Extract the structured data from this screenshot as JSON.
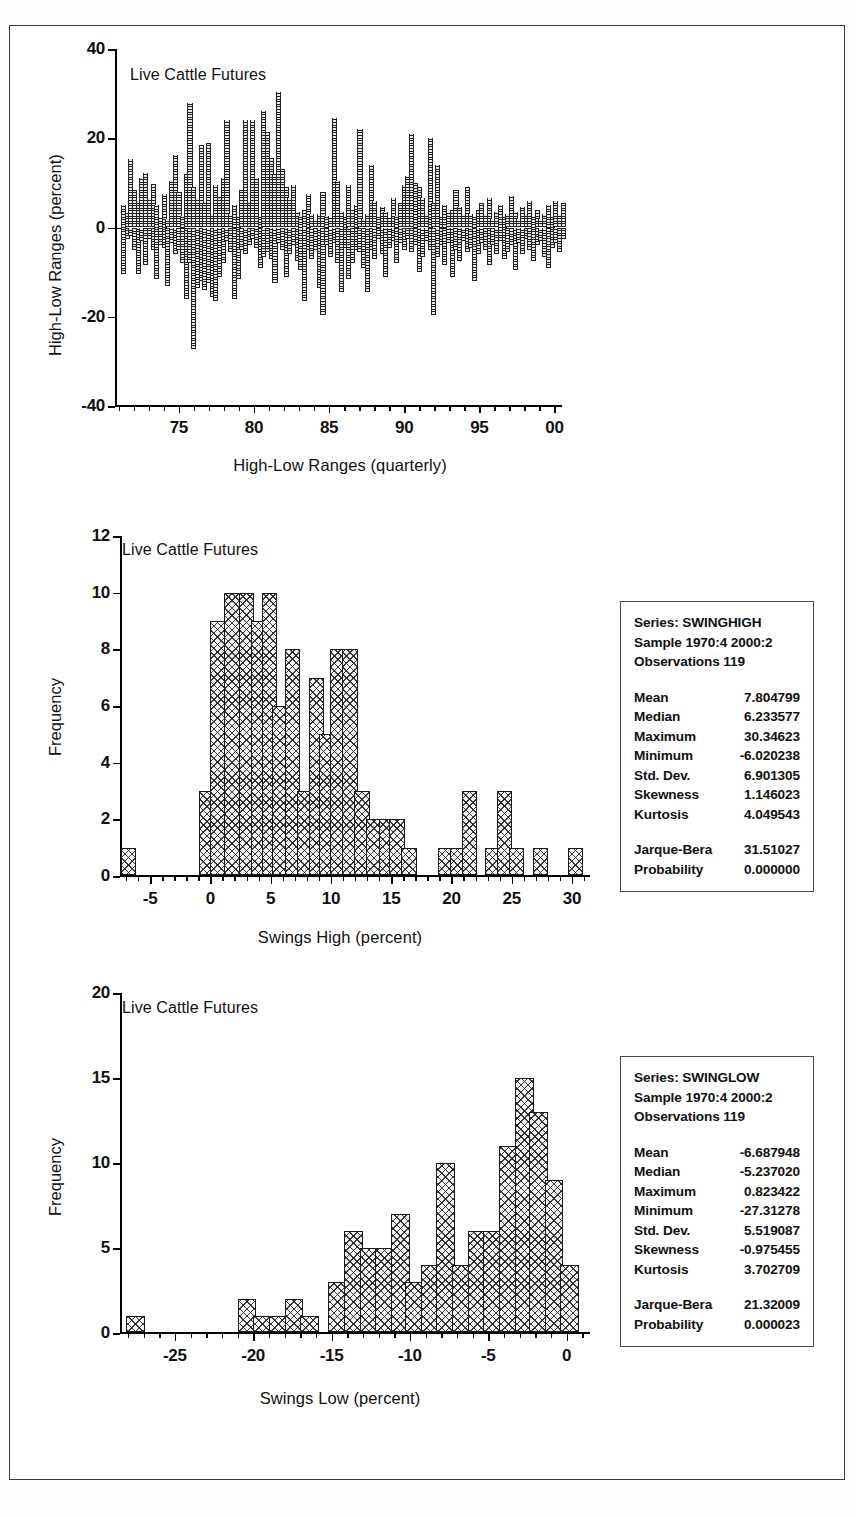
{
  "figure": {
    "border_color": "#3a3a3a",
    "background": "#ffffff"
  },
  "chart_data": [
    {
      "id": "high-low-ranges",
      "type": "bar",
      "title": "Live Cattle Futures",
      "xlabel": "High-Low Ranges (quarterly)",
      "ylabel": "High-Low Ranges (percent)",
      "ylim": [
        -40,
        40
      ],
      "yticks": [
        -40,
        -20,
        0,
        20,
        40
      ],
      "xlim": [
        1970.75,
        2000.5
      ],
      "xticks": [
        75,
        80,
        85,
        90,
        95,
        0
      ],
      "xticklabels": [
        "75",
        "80",
        "85",
        "90",
        "95",
        "00"
      ],
      "xtick_values": [
        1975,
        1980,
        1985,
        1990,
        1995,
        2000
      ],
      "minor_tick_step": 1,
      "grid": false,
      "legend": "none",
      "series": [
        {
          "name": "SWINGHIGH",
          "values": [
            5.0,
            3.2,
            15.4,
            8.5,
            6.0,
            11.0,
            12.2,
            6.5,
            9.8,
            5.0,
            2.2,
            7.5,
            2.0,
            10.5,
            16.3,
            8.0,
            2.5,
            12.0,
            27.8,
            9.0,
            6.5,
            18.5,
            5.5,
            19.0,
            3.0,
            9.5,
            7.0,
            11.2,
            24.0,
            3.0,
            5.0,
            2.5,
            8.5,
            24.0,
            6.0,
            24.0,
            11.2,
            2.5,
            26.0,
            21.5,
            15.5,
            12.0,
            30.3,
            13.0,
            9.0,
            6.5,
            9.5,
            3.5,
            2.5,
            4.0,
            7.5,
            3.0,
            2.0,
            3.0,
            8.0,
            2.5,
            2.2,
            24.5,
            10.5,
            3.5,
            2.5,
            9.5,
            4.0,
            5.0,
            22.0,
            2.0,
            3.0,
            14.0,
            6.0,
            2.5,
            4.5,
            3.5,
            2.2,
            6.5,
            2.5,
            5.5,
            9.5,
            11.5,
            21.0,
            10.0,
            9.0,
            6.5,
            3.0,
            20.0,
            5.5,
            14.0,
            2.5,
            5.0,
            3.5,
            4.0,
            8.5,
            4.5,
            3.0,
            9.0,
            3.0,
            2.5,
            4.0,
            5.5,
            3.0,
            6.5,
            2.0,
            3.5,
            5.0,
            2.5,
            3.0,
            7.0,
            3.5,
            2.0,
            4.5,
            3.0,
            6.0,
            2.5,
            4.0,
            2.0,
            3.0,
            5.0,
            2.5,
            6.0,
            3.0,
            5.5
          ]
        },
        {
          "name": "SWINGLOW",
          "values": [
            -10.5,
            -2.5,
            -2.0,
            -5.0,
            -10.5,
            -3.0,
            -8.5,
            -2.5,
            -5.0,
            -11.5,
            -4.0,
            -4.5,
            -13.0,
            -3.5,
            -6.0,
            -5.0,
            -8.0,
            -16.0,
            -8.0,
            -27.3,
            -13.5,
            -12.0,
            -14.0,
            -12.5,
            -15.5,
            -16.5,
            -11.0,
            -8.0,
            -3.0,
            -5.5,
            -16.0,
            -11.5,
            -5.0,
            -6.0,
            -4.0,
            -2.5,
            -4.5,
            -9.0,
            -6.5,
            -5.5,
            -7.0,
            -12.5,
            -3.5,
            -5.0,
            -11.0,
            -6.0,
            -4.0,
            -7.5,
            -9.5,
            -16.5,
            -5.0,
            -7.0,
            -5.0,
            -13.5,
            -19.5,
            -4.0,
            -6.5,
            -3.5,
            -8.0,
            -14.5,
            -4.5,
            -11.5,
            -8.0,
            -5.0,
            -5.5,
            -9.0,
            -14.5,
            -5.0,
            -7.0,
            -2.5,
            -6.0,
            -11.0,
            -4.5,
            -3.0,
            -8.0,
            -3.5,
            -5.0,
            -2.5,
            -5.5,
            -4.0,
            -10.0,
            -6.5,
            -3.0,
            -5.0,
            -19.5,
            -6.5,
            -4.0,
            -8.5,
            -3.5,
            -11.0,
            -5.0,
            -7.5,
            -3.0,
            -5.5,
            -4.5,
            -12.0,
            -6.0,
            -3.5,
            -5.0,
            -8.5,
            -4.0,
            -6.0,
            -3.0,
            -7.0,
            -5.5,
            -4.0,
            -9.5,
            -3.5,
            -6.0,
            -2.5,
            -5.0,
            -7.5,
            -4.0,
            -3.0,
            -6.5,
            -9.0,
            -4.5,
            -3.5,
            -5.5,
            -2.5
          ]
        }
      ]
    },
    {
      "id": "swinghigh-histogram",
      "type": "bar",
      "title": "Live Cattle Futures",
      "xlabel": "Swings High (percent)",
      "ylabel": "Frequency",
      "ylim": [
        0,
        12
      ],
      "yticks": [
        0,
        2,
        4,
        6,
        8,
        10,
        12
      ],
      "xlim": [
        -7.5,
        31.5
      ],
      "xticks": [
        -5,
        0,
        5,
        10,
        15,
        20,
        25,
        30
      ],
      "xticklabels": [
        "-5",
        "0",
        "5",
        "10",
        "15",
        "20",
        "25",
        "30"
      ],
      "bin_width": 1.3,
      "bin_centers": [
        -6.8,
        -5.5,
        -4.2,
        -2.9,
        -1.6,
        -0.3,
        1.0,
        2.3,
        3.6,
        4.9,
        6.2,
        7.5,
        8.8,
        10.1,
        11.4,
        12.7,
        14.0,
        15.3,
        16.6,
        17.9,
        19.2,
        20.5,
        21.8,
        23.1,
        24.4,
        25.7,
        27.0,
        28.3,
        29.6,
        30.9
      ],
      "values": [
        1,
        0,
        0,
        0,
        0,
        3,
        9,
        10,
        10,
        9,
        10,
        6,
        8,
        3,
        7,
        5,
        8,
        8,
        3,
        2,
        2,
        2,
        1,
        0,
        0,
        1,
        1,
        3,
        0,
        1
      ],
      "bars": [
        {
          "x": -6.8,
          "count": 1
        },
        {
          "x": -0.3,
          "count": 3
        },
        {
          "x": 0.6,
          "count": 9
        },
        {
          "x": 1.8,
          "count": 10
        },
        {
          "x": 3.0,
          "count": 10
        },
        {
          "x": 4.0,
          "count": 9
        },
        {
          "x": 4.9,
          "count": 10
        },
        {
          "x": 5.8,
          "count": 6
        },
        {
          "x": 6.8,
          "count": 8
        },
        {
          "x": 7.8,
          "count": 3
        },
        {
          "x": 8.8,
          "count": 7
        },
        {
          "x": 9.7,
          "count": 5
        },
        {
          "x": 10.6,
          "count": 8
        },
        {
          "x": 11.6,
          "count": 8
        },
        {
          "x": 12.6,
          "count": 3
        },
        {
          "x": 13.6,
          "count": 2
        },
        {
          "x": 14.6,
          "count": 2
        },
        {
          "x": 15.5,
          "count": 2
        },
        {
          "x": 16.5,
          "count": 1
        },
        {
          "x": 19.5,
          "count": 1
        },
        {
          "x": 20.5,
          "count": 1
        },
        {
          "x": 21.5,
          "count": 3
        },
        {
          "x": 23.4,
          "count": 1
        },
        {
          "x": 24.4,
          "count": 3
        },
        {
          "x": 25.4,
          "count": 1
        },
        {
          "x": 27.4,
          "count": 1
        },
        {
          "x": 30.3,
          "count": 1
        }
      ],
      "grid": false,
      "stats": {
        "series_label": "Series: SWINGHIGH",
        "sample_label": "Sample 1970:4 2000:2",
        "observations_label": "Observations 119",
        "rows": [
          {
            "name": "Mean",
            "value": "7.804799"
          },
          {
            "name": "Median",
            "value": "6.233577"
          },
          {
            "name": "Maximum",
            "value": "30.34623"
          },
          {
            "name": "Minimum",
            "value": "-6.020238"
          },
          {
            "name": "Std. Dev.",
            "value": "6.901305"
          },
          {
            "name": "Skewness",
            "value": "1.146023"
          },
          {
            "name": "Kurtosis",
            "value": "4.049543"
          }
        ],
        "test_rows": [
          {
            "name": "Jarque-Bera",
            "value": "31.51027"
          },
          {
            "name": "Probability",
            "value": "0.000000"
          }
        ]
      }
    },
    {
      "id": "swinglow-histogram",
      "type": "bar",
      "title": "Live Cattle Futures",
      "xlabel": "Swings Low (percent)",
      "ylabel": "Frequency",
      "ylim": [
        0,
        20
      ],
      "yticks": [
        0,
        5,
        10,
        15,
        20
      ],
      "xlim": [
        -28.5,
        1.5
      ],
      "xticks": [
        -25,
        -20,
        -15,
        -10,
        -5,
        0
      ],
      "xticklabels": [
        "-25",
        "-20",
        "-15",
        "-10",
        "-5",
        "0"
      ],
      "bin_width": 1.2,
      "bars": [
        {
          "x": -27.5,
          "count": 1
        },
        {
          "x": -20.4,
          "count": 2
        },
        {
          "x": -19.4,
          "count": 1
        },
        {
          "x": -18.4,
          "count": 1
        },
        {
          "x": -17.4,
          "count": 2
        },
        {
          "x": -16.4,
          "count": 1
        },
        {
          "x": -14.6,
          "count": 3
        },
        {
          "x": -13.6,
          "count": 6
        },
        {
          "x": -12.6,
          "count": 5
        },
        {
          "x": -11.6,
          "count": 5
        },
        {
          "x": -10.6,
          "count": 7
        },
        {
          "x": -9.7,
          "count": 3
        },
        {
          "x": -8.7,
          "count": 4
        },
        {
          "x": -7.7,
          "count": 10
        },
        {
          "x": -6.7,
          "count": 4
        },
        {
          "x": -5.7,
          "count": 6
        },
        {
          "x": -4.7,
          "count": 6
        },
        {
          "x": -3.7,
          "count": 11
        },
        {
          "x": -2.7,
          "count": 15
        },
        {
          "x": -1.8,
          "count": 13
        },
        {
          "x": -0.8,
          "count": 9
        },
        {
          "x": 0.2,
          "count": 4
        }
      ],
      "grid": false,
      "stats": {
        "series_label": "Series: SWINGLOW",
        "sample_label": "Sample 1970:4 2000:2",
        "observations_label": "Observations 119",
        "rows": [
          {
            "name": "Mean",
            "value": "-6.687948"
          },
          {
            "name": "Median",
            "value": "-5.237020"
          },
          {
            "name": "Maximum",
            "value": "0.823422"
          },
          {
            "name": "Minimum",
            "value": "-27.31278"
          },
          {
            "name": "Std. Dev.",
            "value": "5.519087"
          },
          {
            "name": "Skewness",
            "value": "-0.975455"
          },
          {
            "name": "Kurtosis",
            "value": "3.702709"
          }
        ],
        "test_rows": [
          {
            "name": "Jarque-Bera",
            "value": "21.32009"
          },
          {
            "name": "Probability",
            "value": "0.000023"
          }
        ]
      }
    }
  ]
}
